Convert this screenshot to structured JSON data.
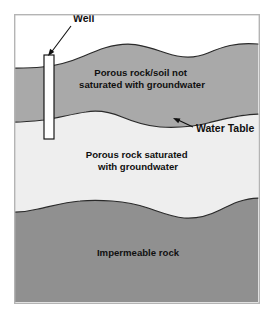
{
  "diagram": {
    "background_color": "#ffffff",
    "frame": {
      "x": 14,
      "y": 14,
      "width": 245,
      "height": 289,
      "border_color": "#b4b4b4"
    },
    "callouts": [
      {
        "id": "well",
        "label": "Well",
        "text_x": 73,
        "text_y": 22,
        "anchor": "start",
        "leader": "M 71 26 L 50 54",
        "arrow_x": 48,
        "arrow_y": 56,
        "arrow_rotate": 127
      },
      {
        "id": "water-table",
        "label": "Water Table",
        "text_x": 196,
        "text_y": 132,
        "anchor": "start",
        "leader": "M 193 127 L 176 119",
        "arrow_x": 173,
        "arrow_y": 118,
        "arrow_rotate": 205
      }
    ],
    "zones": [
      {
        "id": "sky",
        "name": "above-ground-air",
        "label": "",
        "fill": "#ffffff",
        "path": "M 15 15 L 258 15 L 258 44 C 236 42 222 47 208 53 C 194 59 180 58 166 53 C 152 48 140 44 128 44 C 112 44 98 50 84 56 C 70 62 56 66 42 67 C 33 68 24 68 15 68 Z"
      },
      {
        "id": "unsaturated",
        "name": "unsaturated-zone",
        "label": "Porous rock/soil not saturated with groundwater",
        "label_lines": [
          "Porous rock/soil not",
          "saturated with groundwater"
        ],
        "label_x": 142,
        "label_y": 76,
        "line_height": 12,
        "fill": "#a9a9a9",
        "path": "M 15 68 C 24 68 33 68 42 67 C 56 66 70 62 84 56 C 98 50 112 44 128 44 C 140 44 152 48 166 53 C 180 58 194 59 208 53 C 222 47 236 42 258 44 L 258 114 C 240 114 224 119 208 123 C 192 127 176 128 160 127 C 146 126 134 122 122 117 C 110 112 98 110 86 112 C 72 114 58 118 44 120 C 34 121 24 122 15 122 Z",
        "top_edge": "M 15 68 C 24 68 33 68 42 67 C 56 66 70 62 84 56 C 98 50 112 44 128 44 C 140 44 152 48 166 53 C 180 58 194 59 208 53 C 222 47 236 42 258 44",
        "bottom_edge": "M 15 122 C 24 122 34 121 44 120 C 58 118 72 114 86 112 C 98 110 110 112 122 117 C 134 122 146 126 160 127 C 176 128 192 127 208 123 C 224 119 240 114 258 114"
      },
      {
        "id": "saturated",
        "name": "saturated-zone",
        "label": "Porous rock saturated with groundwater",
        "label_lines": [
          "Porous rock saturated",
          "with groundwater"
        ],
        "label_x": 138,
        "label_y": 158,
        "line_height": 12,
        "fill": "#eeeeee",
        "path": "M 15 122 C 24 122 34 121 44 120 C 58 118 72 114 86 112 C 98 110 110 112 122 117 C 134 122 146 126 160 127 C 176 128 192 127 208 123 C 224 119 240 114 258 114 L 258 198 C 244 198 232 204 220 210 C 208 216 196 219 184 218 C 172 217 160 212 148 208 C 136 204 124 202 112 201 C 100 200 90 200 80 201 C 66 202 52 206 38 209 C 30 211 22 212 15 212 Z",
        "bottom_edge": "M 15 212 C 22 212 30 211 38 209 C 52 206 66 202 80 201 C 90 200 100 200 112 201 C 124 202 136 204 148 208 C 160 212 172 217 184 218 C 196 219 208 216 220 210 C 232 204 244 198 258 198"
      },
      {
        "id": "impermeable",
        "name": "impermeable-rock-zone",
        "label": "Impermeable rock",
        "label_lines": [
          "Impermeable rock"
        ],
        "label_x": 138,
        "label_y": 256,
        "line_height": 12,
        "fill": "#909090",
        "path": "M 15 212 C 22 212 30 211 38 209 C 52 206 66 202 80 201 C 90 200 100 200 112 201 C 124 202 136 204 148 208 C 160 212 172 217 184 218 C 196 219 208 216 220 210 C 232 204 244 198 258 198 L 258 302 L 15 302 Z"
      }
    ],
    "well": {
      "name": "well-casing",
      "x": 44,
      "y": 55,
      "width": 10,
      "height": 84,
      "fill": "#ffffff",
      "stroke": "#101010"
    }
  }
}
